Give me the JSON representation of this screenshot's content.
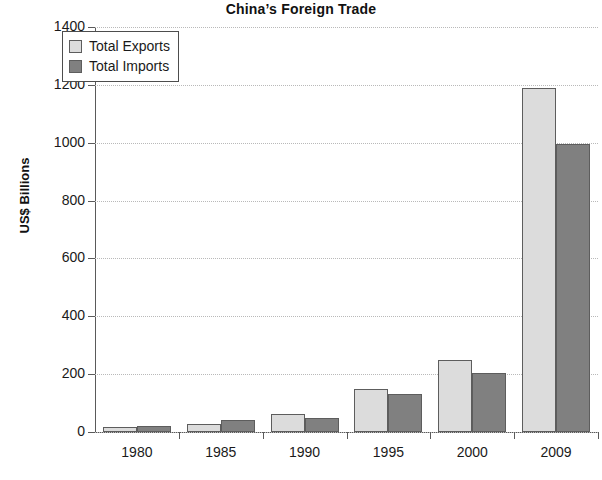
{
  "chart_data": {
    "type": "bar",
    "title": "China’s Foreign Trade",
    "xlabel": "",
    "ylabel": "US$ Billions",
    "categories": [
      "1980",
      "1985",
      "1990",
      "1995",
      "2000",
      "2009"
    ],
    "series": [
      {
        "name": "Total Exports",
        "color": "#dcdcdc",
        "values": [
          18,
          27,
          62,
          149,
          249,
          1190
        ]
      },
      {
        "name": "Total Imports",
        "color": "#808080",
        "values": [
          20,
          42,
          50,
          132,
          205,
          995
        ]
      }
    ],
    "ylim": [
      0,
      1400
    ],
    "yticks": [
      0,
      200,
      400,
      600,
      800,
      1000,
      1200,
      1400
    ],
    "ytick_labels": [
      "0",
      "200",
      "400",
      "600",
      "800",
      "1000",
      "1200",
      "1400"
    ],
    "grid": true,
    "grid_style": "dotted",
    "legend_position": "top-left",
    "legend": [
      "Total Exports",
      "Total Imports"
    ],
    "axis_color": "#5a5a5a",
    "bar_border_color": "#5d5d5d"
  }
}
